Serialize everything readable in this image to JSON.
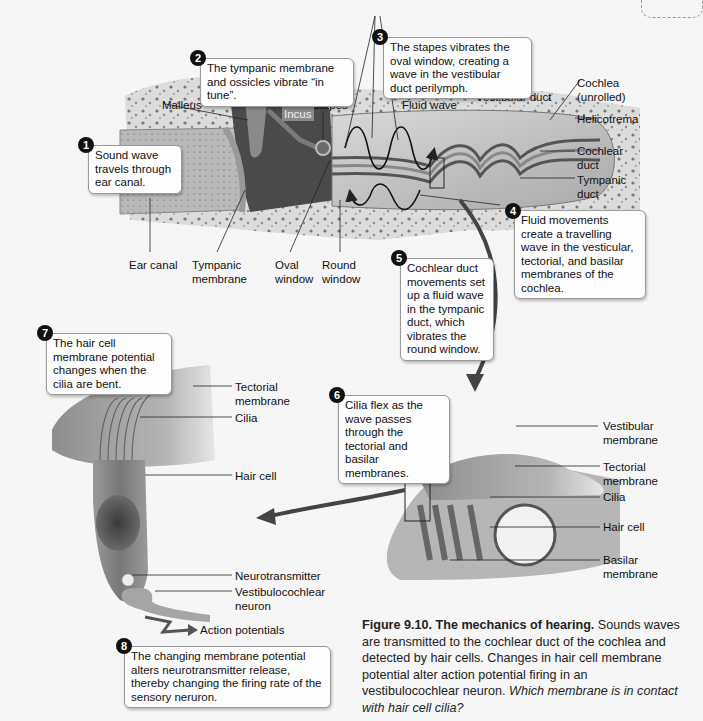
{
  "figure": {
    "number": "Figure 9.10.",
    "title": "The mechanics of hearing.",
    "body": " Sounds waves are transmitted to the cochlear duct of the cochlea and detected by hair cells. Changes in hair cell membrane potential alter action potential firing in an vestibulocochlear neuron. ",
    "question": "Which membrane is in contact with hair cell cilia?"
  },
  "steps": [
    {
      "n": "1",
      "text": "Sound wave travels through ear canal."
    },
    {
      "n": "2",
      "text": "The tympanic membrane and ossicles vibrate “in tune”."
    },
    {
      "n": "3",
      "text": "The stapes vibrates the oval window, creating a wave in the vestibular duct perilymph."
    },
    {
      "n": "4",
      "text": "Fluid movements create a travelling wave in the vesticular, tectorial, and basilar membranes of the cochlea."
    },
    {
      "n": "5",
      "text": "Cochlear duct movements set up a fluid wave in the tympanic duct, which vibrates the round window."
    },
    {
      "n": "6",
      "text": "Cilia flex as the wave passes through the tectorial and basilar membranes."
    },
    {
      "n": "7",
      "text": "The hair cell membrane potential changes when the cilia are bent."
    },
    {
      "n": "8",
      "text": "The changing membrane potential alters neurotransmitter release, thereby changing the firing rate of the sensory neruron."
    }
  ],
  "ear_labels": {
    "malleus": "Malleus",
    "stapes": "Stapes",
    "incus": "Incus",
    "fluid_wave": "Fluid wave",
    "vestibular_duct": "Vestibular duct",
    "cochlea": "Cochlea (unrolled)",
    "helicotrema": "Helicotrema",
    "cochlear_duct": "Cochlear duct",
    "tympanic_duct": "Tympanic duct",
    "ear_canal": "Ear canal",
    "tympanic_membrane": "Tympanic membrane",
    "oval_window": "Oval window",
    "round_window": "Round window"
  },
  "organ_labels": {
    "vestibular_membrane": "Vestibular membrane",
    "tectorial_membrane": "Tectorial membrane",
    "cilia": "Cilia",
    "hair_cell": "Hair cell",
    "basilar_membrane": "Basilar membrane"
  },
  "hair_cell_labels": {
    "tectorial_membrane": "Tectorial membrane",
    "cilia": "Cilia",
    "hair_cell": "Hair cell",
    "neurotransmitter": "Neurotransmitter",
    "neuron": "Vestibulocochlear neuron",
    "action_potentials": "Action potentials"
  }
}
